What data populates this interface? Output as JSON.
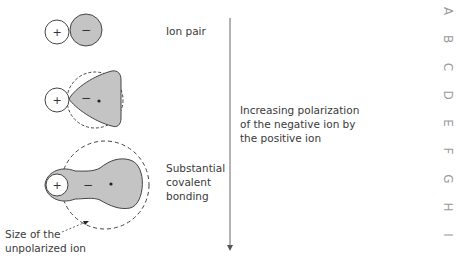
{
  "labels": {
    "ion_pair": "Ion pair",
    "polarization": [
      "Increasing polarization",
      "of the negative ion by",
      "the positive ion"
    ],
    "covalent": [
      "Substantial",
      "covalent",
      "bonding"
    ],
    "unpolarized": [
      "Size of the",
      "unpolarized ion"
    ]
  },
  "symbols": {
    "plus": "+",
    "minus": "−"
  },
  "side_index": [
    "A",
    "B",
    "C",
    "D",
    "E",
    "F",
    "G",
    "H",
    "I"
  ],
  "colors": {
    "fill": "#c4c4c4",
    "stroke": "#444444",
    "text": "#3a3a3a",
    "side": "#9a9a9a"
  }
}
